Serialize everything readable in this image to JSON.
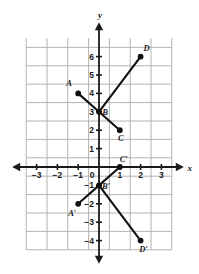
{
  "chart_data": {
    "type": "scatter",
    "title": "",
    "xlabel": "x",
    "ylabel": "y",
    "grid": true,
    "legend": false,
    "xlim": [
      -4,
      3.5
    ],
    "ylim": [
      -4.5,
      7
    ],
    "x_ticks": [
      "-3",
      "-2",
      "-1",
      "0",
      "1",
      "2",
      "3"
    ],
    "x_tick_values": [
      -3,
      -2,
      -1,
      0,
      1,
      2,
      3
    ],
    "y_ticks": [
      "6",
      "5",
      "4",
      "3",
      "2",
      "1",
      "0",
      "-1",
      "-2",
      "-3",
      "-4"
    ],
    "y_tick_values": [
      6,
      5,
      4,
      3,
      2,
      1,
      0,
      -1,
      -2,
      -3,
      -4
    ],
    "origin_label": "0",
    "series": [
      {
        "name": "Figure ABCD",
        "points": [
          {
            "label": "A",
            "x": -1,
            "y": 4,
            "label_dx": -9,
            "label_dy": -7
          },
          {
            "label": "B",
            "x": 0,
            "y": 3,
            "label_dx": 6,
            "label_dy": 3
          },
          {
            "label": "C",
            "x": 1,
            "y": 2,
            "label_dx": 1,
            "label_dy": 11
          },
          {
            "label": "D",
            "x": 2,
            "y": 6,
            "label_dx": 6,
            "label_dy": -6
          }
        ],
        "segments": [
          [
            "A",
            "B"
          ],
          [
            "B",
            "C"
          ],
          [
            "B",
            "D"
          ]
        ]
      },
      {
        "name": "Figure A'B'C'D'",
        "points": [
          {
            "label": "A′",
            "x": -1,
            "y": -2,
            "label_dx": -6,
            "label_dy": 12
          },
          {
            "label": "B′",
            "x": 0,
            "y": -1,
            "label_dx": 7,
            "label_dy": 4
          },
          {
            "label": "C′",
            "x": 1,
            "y": 0,
            "label_dx": 4,
            "label_dy": -5
          },
          {
            "label": "D′",
            "x": 2,
            "y": -4,
            "label_dx": 3,
            "label_dy": 11
          }
        ],
        "segments": [
          [
            "A′",
            "B′"
          ],
          [
            "B′",
            "C′"
          ],
          [
            "B′",
            "D′"
          ]
        ]
      }
    ],
    "colors": {
      "grid": "#b3b3b3",
      "axis": "#1a1a1a",
      "point": "#111111",
      "segment": "#111111",
      "background": "#ffffff"
    }
  }
}
